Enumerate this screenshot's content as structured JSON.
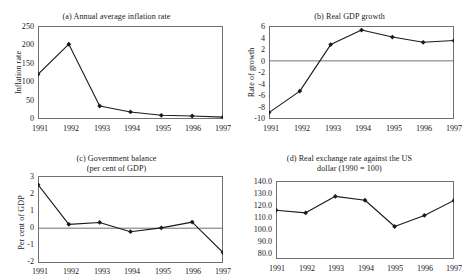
{
  "figure": {
    "background": "#ffffff",
    "line_color": "#1a1a1a",
    "frame_color": "#6f6f6f",
    "marker": "diamond"
  },
  "chart_data": [
    {
      "id": "a",
      "type": "line",
      "title": "(a)  Annual average inflation rate",
      "title_line2": "",
      "xlabel": "",
      "ylabel": "Inflation rate",
      "categories": [
        "1991",
        "1992",
        "1993",
        "1994",
        "1995",
        "1996",
        "1997"
      ],
      "values": [
        120,
        201,
        35,
        19,
        10,
        8,
        5
      ],
      "yticks": [
        "250",
        "200",
        "150",
        "100",
        "50",
        "0"
      ],
      "ylim": [
        0,
        250
      ],
      "grid": false,
      "zero_line": false,
      "legend": "none"
    },
    {
      "id": "b",
      "type": "line",
      "title": "(b)  Real GDP growth",
      "title_line2": "",
      "xlabel": "",
      "ylabel": "Rate of growth",
      "categories": [
        "1991",
        "1992",
        "1993",
        "1994",
        "1995",
        "1996",
        "1997"
      ],
      "values": [
        -8.9,
        -5.2,
        2.8,
        5.3,
        4.1,
        3.2,
        3.5
      ],
      "yticks": [
        "6",
        "4",
        "2",
        "0",
        "-2",
        "-4",
        "-6",
        "-8",
        "-10"
      ],
      "ylim": [
        -10,
        6
      ],
      "grid": false,
      "zero_line": true,
      "legend": "none"
    },
    {
      "id": "c",
      "type": "line",
      "title": "(c)  Government balance",
      "title_line2": "(per cent of GDP)",
      "xlabel": "",
      "ylabel": "Per cent of GDP",
      "categories": [
        "1991",
        "1992",
        "1993",
        "1994",
        "1995",
        "1996",
        "1997"
      ],
      "values": [
        2.5,
        0.22,
        0.33,
        -0.2,
        0.02,
        0.35,
        -1.4
      ],
      "yticks": [
        "3",
        "2",
        "1",
        "0",
        "-1",
        "-2"
      ],
      "ylim": [
        -2,
        3
      ],
      "grid": false,
      "zero_line": true,
      "legend": "none"
    },
    {
      "id": "d",
      "type": "line",
      "title": "(d)  Real exchange rate against the US",
      "title_line2": "dollar (1990 = 100)",
      "xlabel": "",
      "ylabel": "",
      "categories": [
        "1991",
        "1992",
        "1993",
        "1994",
        "1995",
        "1996",
        "1997"
      ],
      "values": [
        117.5,
        115.5,
        128.2,
        125.2,
        105.0,
        113.5,
        125.0
      ],
      "yticks": [
        "140.0",
        "130.0",
        "120.0",
        "110.0",
        "100.0",
        "90.0",
        "80.0"
      ],
      "ylim": [
        80,
        140
      ],
      "grid": false,
      "zero_line": false,
      "legend": "none"
    }
  ]
}
